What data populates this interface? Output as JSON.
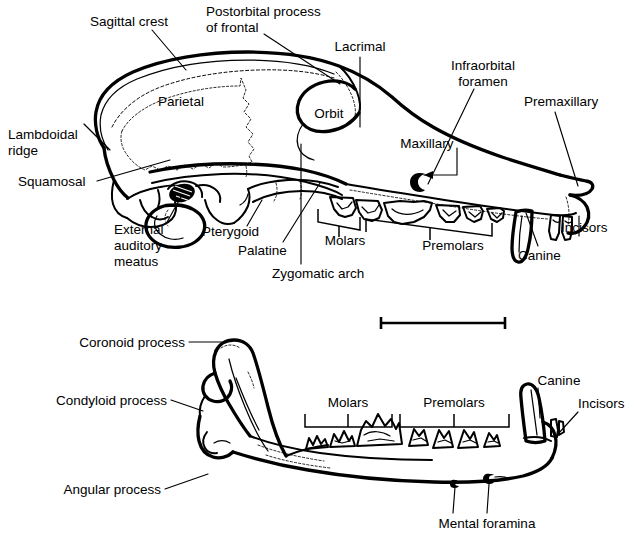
{
  "figure": {
    "background_color": "#ffffff",
    "ink_color": "#000000",
    "width": 638,
    "height": 547,
    "caption_cropped": ""
  },
  "panels": {
    "skull": {
      "name": "Lateral view of cranium",
      "bone_labels": [
        {
          "id": "parietal",
          "text": "Parietal"
        },
        {
          "id": "orbit",
          "text": "Orbit"
        },
        {
          "id": "maxillary",
          "text": "Maxillary"
        }
      ],
      "leader_labels": [
        {
          "id": "sagittal-crest",
          "text": "Sagittal crest"
        },
        {
          "id": "postorbital-process",
          "text": "Postorbital process",
          "text2": "of frontal"
        },
        {
          "id": "lacrimal",
          "text": "Lacrimal"
        },
        {
          "id": "infraorbital-foramen",
          "text": "Infraorbital",
          "text2": "foramen"
        },
        {
          "id": "premaxillary",
          "text": "Premaxillary"
        },
        {
          "id": "lambdoidal-ridge",
          "text": "Lambdoidal",
          "text2": "ridge"
        },
        {
          "id": "squamosal",
          "text": "Squamosal"
        },
        {
          "id": "external-auditory-meatus",
          "text": "External",
          "text2": "auditory",
          "text3": "meatus"
        },
        {
          "id": "pterygoid",
          "text": "Pterygoid"
        },
        {
          "id": "palatine",
          "text": "Palatine"
        },
        {
          "id": "zygomatic-arch",
          "text": "Zygomatic arch"
        },
        {
          "id": "incisors",
          "text": "Incisors"
        },
        {
          "id": "canine",
          "text": "Canine"
        }
      ],
      "tooth_brackets": [
        {
          "id": "molars",
          "text": "Molars"
        },
        {
          "id": "premolars",
          "text": "Premolars"
        }
      ]
    },
    "mandible": {
      "name": "Lateral view of lower jaw",
      "leader_labels": [
        {
          "id": "coronoid-process",
          "text": "Coronoid process"
        },
        {
          "id": "condyloid-process",
          "text": "Condyloid process"
        },
        {
          "id": "angular-process",
          "text": "Angular process"
        },
        {
          "id": "canine",
          "text": "Canine"
        },
        {
          "id": "incisors",
          "text": "Incisors"
        },
        {
          "id": "mental-foramina",
          "text": "Mental foramina"
        }
      ],
      "tooth_brackets": [
        {
          "id": "molars",
          "text": "Molars"
        },
        {
          "id": "premolars",
          "text": "Premolars"
        }
      ]
    }
  },
  "scale_bar": {
    "name": "scale-bar",
    "label": "",
    "x_start": 380,
    "x_end": 506,
    "y": 323
  }
}
